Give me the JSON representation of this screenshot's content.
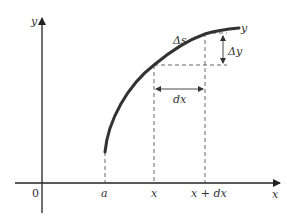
{
  "diagram": {
    "type": "arc-length-element",
    "colors": {
      "axis": "#222222",
      "curve": "#333333",
      "dash": "#555555",
      "text": "#333333"
    },
    "axes": {
      "y_label": "y",
      "x_label": "x",
      "origin_label": "0"
    },
    "curve_label": "y",
    "x_ticks": [
      {
        "label": "a"
      },
      {
        "label": "x"
      },
      {
        "label": "x + dx"
      }
    ],
    "annotations": {
      "delta_s": "Δs",
      "delta_y": "Δy",
      "dx": "dx"
    }
  }
}
